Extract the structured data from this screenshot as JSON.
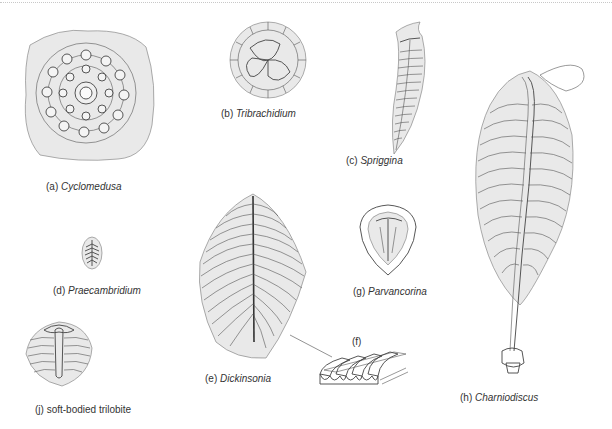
{
  "figures": [
    {
      "id": "a",
      "prefix": "(a) ",
      "name": "Cyclomedusa"
    },
    {
      "id": "b",
      "prefix": "(b) ",
      "name": "Tribrachidium"
    },
    {
      "id": "c",
      "prefix": "(c) ",
      "name": "Spriggina"
    },
    {
      "id": "d",
      "prefix": "(d) ",
      "name": "Praecambridium"
    },
    {
      "id": "e",
      "prefix": "(e) ",
      "name": "Dickinsonia"
    },
    {
      "id": "f",
      "prefix": "(f)",
      "name": ""
    },
    {
      "id": "g",
      "prefix": "(g) ",
      "name": "Parvancorina"
    },
    {
      "id": "h",
      "prefix": "(h) ",
      "name": "Charniodiscus"
    },
    {
      "id": "j",
      "prefix": "(j) ",
      "name": "soft-bodied trilobite"
    }
  ]
}
